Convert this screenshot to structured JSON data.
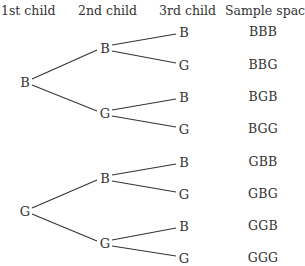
{
  "headers": {
    "col1": "1st child",
    "col2": "2nd child",
    "col3": "3rd child",
    "col4": "Sample space"
  },
  "tree": {
    "level1": [
      {
        "label": "B",
        "x": 25,
        "y": 82
      },
      {
        "label": "G",
        "x": 25,
        "y": 211
      }
    ],
    "level2": [
      {
        "label": "B",
        "x": 105,
        "y": 48
      },
      {
        "label": "G",
        "x": 105,
        "y": 113
      },
      {
        "label": "B",
        "x": 105,
        "y": 178
      },
      {
        "label": "G",
        "x": 105,
        "y": 243
      }
    ],
    "level3": [
      {
        "label": "B",
        "x": 184,
        "y": 32
      },
      {
        "label": "G",
        "x": 184,
        "y": 65
      },
      {
        "label": "B",
        "x": 184,
        "y": 97
      },
      {
        "label": "G",
        "x": 184,
        "y": 129
      },
      {
        "label": "B",
        "x": 184,
        "y": 162
      },
      {
        "label": "G",
        "x": 184,
        "y": 194
      },
      {
        "label": "B",
        "x": 184,
        "y": 226
      },
      {
        "label": "G",
        "x": 184,
        "y": 258
      }
    ]
  },
  "sample_space": [
    "BBB",
    "BBG",
    "BGB",
    "BGG",
    "GBB",
    "GBG",
    "GGB",
    "GGG"
  ]
}
